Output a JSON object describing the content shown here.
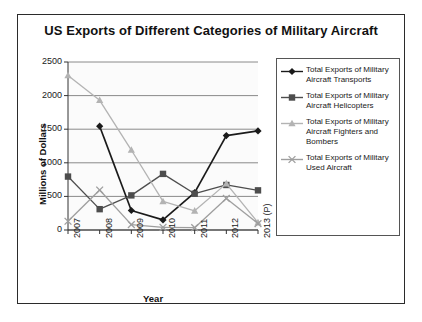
{
  "chart_data": {
    "type": "line",
    "title": "US Exports of Different Categories of Military Aircraft",
    "xlabel": "Year",
    "ylabel": "Millions of Dollars",
    "categories": [
      "2007",
      "2008",
      "2009",
      "2010",
      "2011",
      "2012",
      "2013 (P)"
    ],
    "ylim": [
      0,
      2500
    ],
    "yticks": [
      0,
      500,
      1000,
      1500,
      2000,
      2500
    ],
    "grid": true,
    "legend_position": "right",
    "series": [
      {
        "name": "Total Exports of Military Aircraft Transports",
        "marker": "diamond",
        "color": "#1a1a1a",
        "values": [
          null,
          1545,
          290,
          150,
          555,
          1405,
          1475
        ]
      },
      {
        "name": "Total Exports of Military Aircraft Helicopters",
        "marker": "square",
        "color": "#4d4d4d",
        "values": [
          795,
          310,
          515,
          835,
          540,
          670,
          590
        ]
      },
      {
        "name": "Total Exports of Military Aircraft Fighters and Bombers",
        "marker": "triangle",
        "color": "#b3b3b3",
        "values": [
          2300,
          1930,
          1190,
          425,
          285,
          690,
          110
        ]
      },
      {
        "name": "Total Exports of Military Used Aircraft",
        "marker": "cross",
        "color": "#9e9e9e",
        "values": [
          130,
          595,
          80,
          40,
          35,
          470,
          95
        ]
      }
    ]
  },
  "legend": {
    "entries": [
      "Total Exports of Military Aircraft Transports",
      "Total Exports of Military Aircraft Helicopters",
      "Total Exports of Military Aircraft Fighters and Bombers",
      "Total Exports of Military Used Aircraft"
    ]
  }
}
